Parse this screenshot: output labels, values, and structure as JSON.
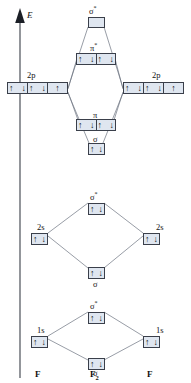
{
  "diagram": {
    "title_axis": "E",
    "molecule": "F2",
    "axis": {
      "label": "E",
      "direction": "up"
    },
    "bottom_labels": [
      {
        "name": "left-atom",
        "text": "F"
      },
      {
        "name": "molecule",
        "text": "F",
        "sub": "2"
      },
      {
        "name": "right-atom",
        "text": "F"
      }
    ],
    "colors": {
      "box_fill": "#dfe6f0",
      "box_stroke": "#3a3f4a",
      "line": "#6b7280",
      "text": "#111111",
      "background": "#ffffff"
    },
    "levels": {
      "p_block": {
        "sigma_star_2p": {
          "label": "σ",
          "star": "*",
          "boxes": 1,
          "electrons": [
            0
          ]
        },
        "pi_star_2p": {
          "label": "π",
          "star": "*",
          "boxes": 2,
          "electrons": [
            2,
            2
          ]
        },
        "atomic_2p_left": {
          "label": "2p",
          "boxes": 3,
          "electrons": [
            2,
            2,
            1
          ]
        },
        "atomic_2p_right": {
          "label": "2p",
          "boxes": 3,
          "electrons": [
            2,
            2,
            1
          ]
        },
        "pi_2p": {
          "label": "π",
          "star": "",
          "boxes": 2,
          "electrons": [
            2,
            2
          ]
        },
        "sigma_2p": {
          "label": "σ",
          "star": "",
          "boxes": 1,
          "electrons": [
            2
          ]
        }
      },
      "s2_block": {
        "sigma_star_2s": {
          "label": "σ",
          "star": "*",
          "boxes": 1,
          "electrons": [
            2
          ]
        },
        "atomic_2s_left": {
          "label": "2s",
          "boxes": 1,
          "electrons": [
            2
          ]
        },
        "atomic_2s_right": {
          "label": "2s",
          "boxes": 1,
          "electrons": [
            2
          ]
        },
        "sigma_2s": {
          "label": "σ",
          "star": "",
          "boxes": 1,
          "electrons": [
            2
          ]
        }
      },
      "s1_block": {
        "sigma_star_1s": {
          "label": "σ",
          "star": "*",
          "boxes": 1,
          "electrons": [
            2
          ]
        },
        "atomic_1s_left": {
          "label": "1s",
          "boxes": 1,
          "electrons": [
            2
          ]
        },
        "atomic_1s_right": {
          "label": "1s",
          "boxes": 1,
          "electrons": [
            2
          ]
        },
        "sigma_1s": {
          "label": "σ",
          "star": "",
          "boxes": 1,
          "electrons": [
            2
          ]
        }
      }
    },
    "glyphs": {
      "spin_up": "↑",
      "spin_down": "↓"
    }
  }
}
